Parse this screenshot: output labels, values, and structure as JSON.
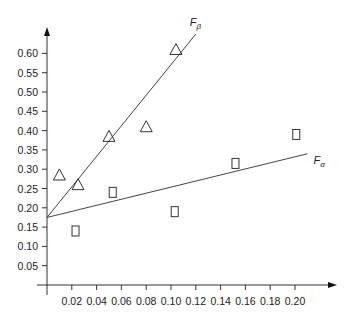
{
  "chart_data": {
    "type": "scatter",
    "title": "",
    "xlabel": "",
    "ylabel": "",
    "xlim": [
      0,
      0.22
    ],
    "ylim": [
      0,
      0.65
    ],
    "grid": false,
    "legend": "none (lines labeled inline)",
    "x_ticks": [
      "0.02",
      "0.04",
      "0.06",
      "0.08",
      "0.10",
      "0.12",
      "0.14",
      "0.16",
      "0.18",
      "0.20"
    ],
    "y_ticks": [
      "0.05",
      "0.10",
      "0.15",
      "0.20",
      "0.25",
      "0.30",
      "0.35",
      "0.40",
      "0.45",
      "0.50",
      "0.55",
      "0.60"
    ],
    "series": [
      {
        "name": "F_beta",
        "label": "F",
        "subscript": "β",
        "marker": "triangle",
        "points": [
          [
            0.01,
            0.285
          ],
          [
            0.025,
            0.26
          ],
          [
            0.05,
            0.385
          ],
          [
            0.08,
            0.41
          ],
          [
            0.104,
            0.61
          ]
        ],
        "fit_line": [
          [
            0.0,
            0.175
          ],
          [
            0.12,
            0.65
          ]
        ]
      },
      {
        "name": "F_alpha",
        "label": "F",
        "subscript": "α",
        "marker": "square",
        "points": [
          [
            0.023,
            0.14
          ],
          [
            0.053,
            0.24
          ],
          [
            0.103,
            0.19
          ],
          [
            0.152,
            0.315
          ],
          [
            0.201,
            0.39
          ]
        ],
        "fit_line": [
          [
            0.0,
            0.175
          ],
          [
            0.21,
            0.34
          ]
        ]
      }
    ]
  }
}
